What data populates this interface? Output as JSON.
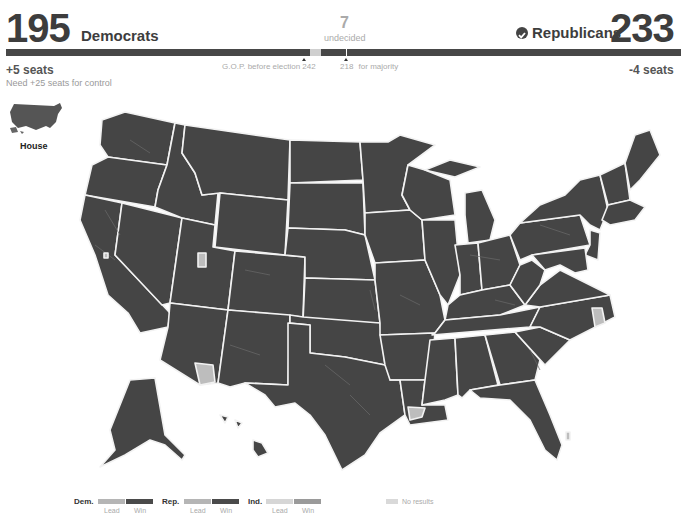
{
  "header": {
    "democrats": {
      "count": "195",
      "label": "Democrats",
      "change": "+5 seats",
      "need": "Need +25 seats for control"
    },
    "undecided": {
      "count": "7",
      "label": "undecided"
    },
    "republicans": {
      "count": "233",
      "label": "Republicans",
      "change": "-4 seats",
      "winner_icon": "check-circle-icon"
    }
  },
  "bar": {
    "markers": {
      "gop_before_label": "G.O.P. before election",
      "gop_before_value": "242",
      "majority_value": "218",
      "majority_label": "for majority"
    },
    "colors": {
      "dem": "#474747",
      "undecided": "#cfcfcf",
      "rep": "#474747"
    }
  },
  "thumbnail": {
    "label": "House"
  },
  "legend": {
    "dem": {
      "label": "Dem.",
      "lead": "Lead",
      "win": "Win",
      "lead_color": "#b5b5b5",
      "win_color": "#4a4a4a"
    },
    "rep": {
      "label": "Rep.",
      "lead": "Lead",
      "win": "Win",
      "lead_color": "#b5b5b5",
      "win_color": "#4a4a4a"
    },
    "ind": {
      "label": "Ind.",
      "lead": "Lead",
      "win": "Win",
      "lead_color": "#d6d6d6",
      "win_color": "#9a9a9a"
    },
    "no_results": {
      "label": "No results",
      "color": "#d9d9d9"
    }
  },
  "map": {
    "fill": "#454545",
    "no_results_fill": "#bdbdbd",
    "no_results_regions": [
      "Utah district",
      "Arizona southern district",
      "Louisiana coastal district",
      "North Carolina eastern district",
      "Florida east coast district",
      "California northern district"
    ]
  }
}
